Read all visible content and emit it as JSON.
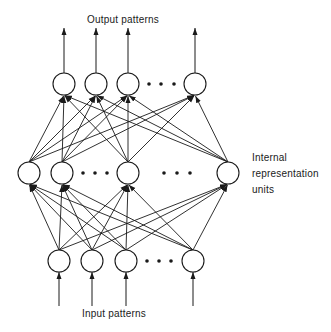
{
  "labels": {
    "output": "Output patterns",
    "hidden_line1": "Internal",
    "hidden_line2": "representation",
    "hidden_line3": "units",
    "input": "Input patterns"
  },
  "colors": {
    "ink": "#1a1a1a",
    "background": "#ffffff"
  },
  "layers": {
    "output": {
      "y": 84,
      "nodes_x": [
        64,
        96,
        128,
        195
      ],
      "ellipsis_x": [
        149,
        161,
        174
      ]
    },
    "hidden": {
      "y": 173,
      "nodes_x": [
        29,
        62,
        128,
        228
      ],
      "ellipsis_x": [
        83,
        95,
        107,
        164,
        177,
        190
      ]
    },
    "input": {
      "y": 261,
      "nodes_x": [
        59,
        92,
        126,
        193
      ],
      "ellipsis_x": [
        147,
        159,
        171
      ]
    }
  },
  "node_radius": 11
}
